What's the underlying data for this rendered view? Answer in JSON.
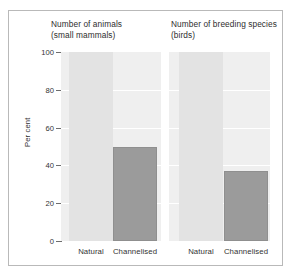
{
  "chart_data": {
    "type": "bar",
    "title": "",
    "ylabel": "Per cent",
    "xlabel": "",
    "ylim": [
      0,
      100
    ],
    "yticks": [
      0,
      20,
      40,
      60,
      80,
      100
    ],
    "grid": true,
    "legend": "none",
    "panels": [
      {
        "title_line1": "Number of animals",
        "title_line2": "(small mammals)",
        "categories": [
          "Natural",
          "Channelised"
        ],
        "values": [
          100,
          50
        ],
        "colors": [
          "#e3e3e3",
          "#9b9b9b"
        ]
      },
      {
        "title_line1": "Number of breeding species",
        "title_line2": "(birds)",
        "categories": [
          "Natural",
          "Channelised"
        ],
        "values": [
          100,
          37
        ],
        "colors": [
          "#e3e3e3",
          "#9b9b9b"
        ]
      }
    ]
  },
  "style": {
    "plot_background": "#efefef",
    "gridline_color": "#ffffff",
    "axis_color": "#6d6d6d",
    "frame_color": "#b9b9b9",
    "light_bar_color": "#e3e3e3",
    "dark_bar_color": "#9b9b9b",
    "text_color": "#333333"
  }
}
